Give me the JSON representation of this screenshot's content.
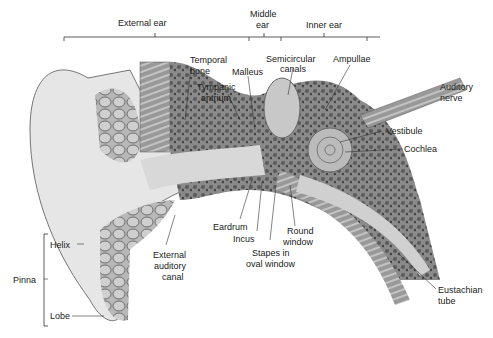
{
  "diagram": {
    "regions": [
      {
        "label": "External ear"
      },
      {
        "label": "Middle ear"
      },
      {
        "label": "Inner ear"
      }
    ],
    "labels": {
      "external_ear": "External ear",
      "middle_ear_1": "Middle",
      "middle_ear_2": "ear",
      "inner_ear": "Inner ear",
      "temporal_bone_1": "Temporal",
      "temporal_bone_2": "bone",
      "malleus": "Malleus",
      "tympanic_antrium_1": "Tympanic",
      "tympanic_antrium_2": "antrium",
      "semicircular_canals_1": "Semicircular",
      "semicircular_canals_2": "canals",
      "ampullae": "Ampullae",
      "auditory_nerve_1": "Auditory",
      "auditory_nerve_2": "nerve",
      "vestibule": "Vestibule",
      "cochlea": "Cochlea",
      "eardrum": "Eardrum",
      "incus": "Incus",
      "round_window_1": "Round",
      "round_window_2": "window",
      "stapes_1": "Stapes in",
      "stapes_2": "oval window",
      "external_auditory_canal_1": "External",
      "external_auditory_canal_2": "auditory",
      "external_auditory_canal_3": "canal",
      "helix": "Helix",
      "pinna": "Pinna",
      "lobe": "Lobe",
      "eustachian_tube_1": "Eustachian",
      "eustachian_tube_2": "tube"
    }
  }
}
